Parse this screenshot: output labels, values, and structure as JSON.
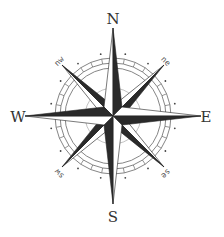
{
  "compass": {
    "cardinals": {
      "n": "N",
      "e": "E",
      "s": "S",
      "w": "W"
    },
    "intercardinals": {
      "ne": "ne",
      "se": "se",
      "sw": "sw",
      "nw": "nw"
    },
    "colors": {
      "dark": "#2a2a2a",
      "light": "#ffffff",
      "ring": "#555555"
    }
  }
}
